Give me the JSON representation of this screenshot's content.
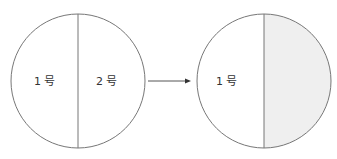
{
  "diagram": {
    "left_circle": {
      "left_half_label": "1 号",
      "right_half_label": "2 号"
    },
    "arrow": {
      "direction": "right"
    },
    "right_circle": {
      "left_half_label": "1 号",
      "right_half_label": "",
      "right_half_fill": "#efefef"
    },
    "colors": {
      "stroke": "#777777",
      "text": "#333333",
      "shaded": "#efefef"
    }
  }
}
